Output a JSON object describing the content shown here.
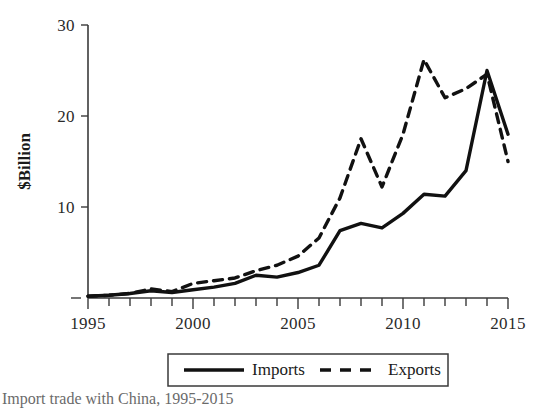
{
  "figure": {
    "caption": "Import trade with China, 1995-2015"
  },
  "chart_data": {
    "type": "line",
    "title": "",
    "xlabel": "",
    "ylabel": "$Billion",
    "xlim": [
      1995,
      2015
    ],
    "ylim": [
      0,
      30
    ],
    "grid": false,
    "legend_position": "bottom",
    "x": [
      1995,
      1996,
      1997,
      1998,
      1999,
      2000,
      2001,
      2002,
      2003,
      2004,
      2005,
      2006,
      2007,
      2008,
      2009,
      2010,
      2011,
      2012,
      2013,
      2014,
      2015
    ],
    "xticks": [
      1995,
      2000,
      2005,
      2010,
      2015
    ],
    "xtick_labels": [
      "1995",
      "2000",
      "2005",
      "2010",
      "2015"
    ],
    "yticks": [
      10,
      20,
      30
    ],
    "ytick_labels": [
      "10",
      "20",
      "30"
    ],
    "y_zero_dash": true,
    "series": [
      {
        "name": "Imports",
        "style": "solid",
        "color": "#111111",
        "values": [
          0.2,
          0.3,
          0.5,
          0.8,
          0.6,
          0.9,
          1.2,
          1.6,
          2.5,
          2.3,
          2.8,
          3.6,
          7.4,
          8.2,
          7.7,
          9.3,
          11.4,
          11.2,
          14.0,
          25.0,
          18.0
        ]
      },
      {
        "name": "Exports",
        "style": "dashed",
        "color": "#111111",
        "values": [
          0.2,
          0.3,
          0.5,
          1.0,
          0.7,
          1.6,
          1.9,
          2.2,
          3.0,
          3.6,
          4.6,
          6.6,
          11.0,
          17.5,
          12.2,
          18.0,
          26.2,
          22.0,
          23.0,
          24.6,
          15.0
        ]
      }
    ]
  },
  "legend": {
    "entries": [
      {
        "label": "Imports",
        "style": "solid"
      },
      {
        "label": "Exports",
        "style": "dashed"
      }
    ]
  }
}
